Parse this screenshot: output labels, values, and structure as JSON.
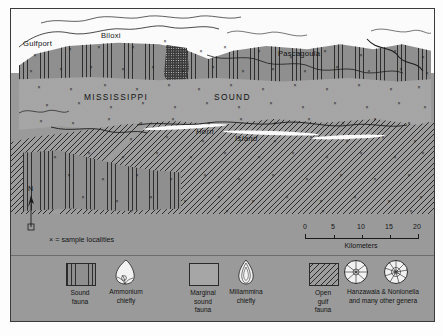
{
  "figure": {
    "type": "map"
  },
  "map": {
    "places": [
      {
        "name": "Gulfport",
        "style": "city"
      },
      {
        "name": "Biloxi",
        "style": "city"
      },
      {
        "name": "Pascagoula",
        "style": "city"
      },
      {
        "name": "MISSISSIPPI",
        "style": "water-body"
      },
      {
        "name": "SOUND",
        "style": "water-body"
      },
      {
        "name": "Horn",
        "style": "island"
      },
      {
        "name": "Island",
        "style": "island"
      }
    ],
    "north_arrow_label": "N",
    "sample_key": "× = sample localities"
  },
  "scale": {
    "ticks": [
      "0",
      "5",
      "10",
      "15",
      "20"
    ],
    "units_label": "Kilometers"
  },
  "legend": {
    "entries": [
      {
        "pattern": "vertical-lines",
        "fauna": "Sound\nfauna",
        "fauna_line1": "Sound",
        "fauna_line2": "fauna",
        "genus_line1": "Ammonium",
        "genus_line2": "chiefly",
        "foram_icon": "ammonia-test-icon"
      },
      {
        "pattern": "stipple-dots",
        "fauna_line1": "Marginal",
        "fauna_line2": "sound",
        "fauna_line3": "fauna",
        "genus_line1": "Miliammina",
        "genus_line2": "chiefly",
        "foram_icon": "miliammina-test-icon"
      },
      {
        "pattern": "diagonal-hatch",
        "fauna_line1": "Open",
        "fauna_line2": "gulf",
        "fauna_line3": "fauna",
        "genus_line1": "Hanzawaia & Nonionella",
        "genus_line2": "and many other genera",
        "foram_icon1": "hanzawaia-test-icon",
        "foram_icon2": "nonionella-test-icon"
      }
    ]
  },
  "colors": {
    "paper": "#9a9a9a",
    "ink": "#1c1c1c",
    "water": "#fbfbfb",
    "dark_patch": "#3b3b3b"
  }
}
